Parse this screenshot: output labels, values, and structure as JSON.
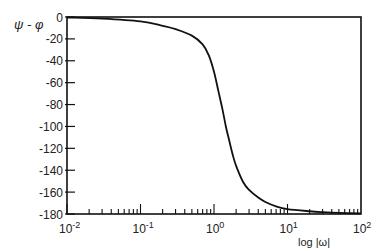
{
  "chart_data": {
    "type": "line",
    "title": "",
    "ylabel": "ψ - φ",
    "xlabel": "log |ω|",
    "xscale": "log",
    "xlim": [
      0.01,
      100
    ],
    "ylim": [
      -180,
      0
    ],
    "grid": false,
    "legend": null,
    "x_ticks": [
      {
        "value": 0.01,
        "base": "10",
        "exp": "-2"
      },
      {
        "value": 0.1,
        "base": "10",
        "exp": "-1"
      },
      {
        "value": 1,
        "base": "10",
        "exp": "0"
      },
      {
        "value": 10,
        "base": "10",
        "exp": "1"
      },
      {
        "value": 100,
        "base": "10",
        "exp": "2"
      }
    ],
    "y_ticks": [
      0,
      -20,
      -40,
      -60,
      -80,
      -100,
      -120,
      -140,
      -160,
      -180
    ],
    "y_tick_labels": [
      "0",
      "-20",
      "-40",
      "-60",
      "-80",
      "-100",
      "-120",
      "-140",
      "-160",
      "-180"
    ],
    "series": [
      {
        "name": "phase",
        "x": [
          0.01,
          0.03,
          0.1,
          0.2,
          0.3,
          0.5,
          0.7,
          0.85,
          1.0,
          1.15,
          1.3,
          1.45,
          1.6,
          1.8,
          2.0,
          2.5,
          3.0,
          4.0,
          5.0,
          7.0,
          10,
          20,
          30,
          50,
          100
        ],
        "values": [
          -0.5,
          -1.5,
          -4,
          -8,
          -11,
          -17,
          -25,
          -35,
          -50,
          -68,
          -84,
          -100,
          -112,
          -126,
          -136,
          -151,
          -158,
          -165,
          -169,
          -173,
          -175.5,
          -177.5,
          -178.3,
          -179,
          -179.5
        ]
      }
    ]
  }
}
